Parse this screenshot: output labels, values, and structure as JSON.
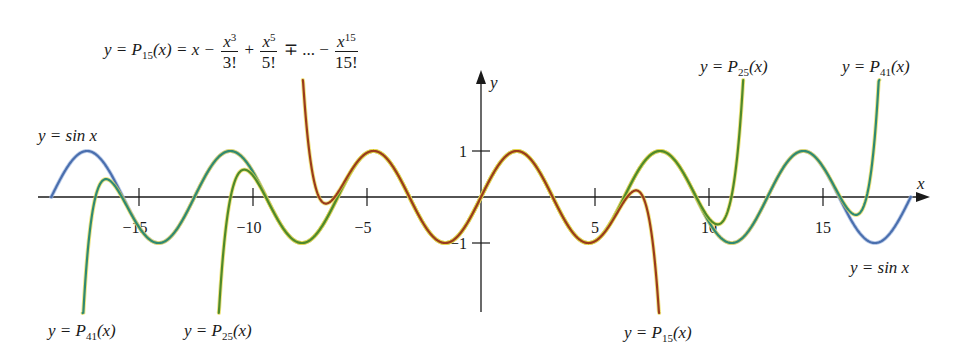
{
  "chart_data": {
    "type": "line",
    "title": "",
    "xlabel": "x",
    "ylabel": "y",
    "xlim": [
      -19.2,
      19.2
    ],
    "ylim": [
      -2.5,
      2.5
    ],
    "grid": false,
    "x_ticks": [
      -15,
      -10,
      -5,
      5,
      10,
      15
    ],
    "x_tick_labels": [
      "−15",
      "−10",
      "−5",
      "5",
      "10",
      "15"
    ],
    "y_ticks": [
      1,
      -1
    ],
    "y_tick_labels": [
      "1",
      "−1"
    ],
    "series": [
      {
        "name": "y = sin x",
        "function": "sin",
        "x_range": [
          -18.85,
          18.85
        ],
        "color": "#4a6fae"
      },
      {
        "name": "y = P15(x)",
        "function": "taylor_sin",
        "degree": 15,
        "x_range": [
          -8.0,
          8.0
        ],
        "color": "#9b3b1c"
      },
      {
        "name": "y = P25(x)",
        "function": "taylor_sin",
        "degree": 25,
        "x_range": [
          -12.0,
          12.0
        ],
        "color": "#4f8a2a"
      },
      {
        "name": "y = P41(x)",
        "function": "taylor_sin",
        "degree": 41,
        "x_range": [
          -17.5,
          17.5
        ],
        "color": "#2f8a72"
      }
    ],
    "annotations": [
      "y = P15(x) = x − x^3/3! + x^5/5! ∓ ... − x^15/15!",
      "y = sin x",
      "y = P41(x)",
      "y = P25(x)",
      "y = P15(x)",
      "y = P25(x)",
      "y = P41(x)",
      "y = sin x"
    ]
  },
  "labels": {
    "formula_lhs": "y = P",
    "formula_sub": "15",
    "formula_mid": "(x) = x −",
    "f1_num": "x",
    "f1_sup": "3",
    "f1_den": "3!",
    "plus": "+",
    "f2_num": "x",
    "f2_sup": "5",
    "f2_den": "5!",
    "mp": "∓ ...  −",
    "f3_num": "x",
    "f3_sup": "15",
    "f3_den": "15!",
    "sin_left": "y = sin x",
    "sin_right": "y = sin x",
    "p41_bottom": "41",
    "p25_bottom": "25",
    "p15_bottom": "15",
    "p25_top": "25",
    "p41_top": "41",
    "y_eq_P": "y = P",
    "paren_x": "(x)",
    "axis_x": "x",
    "axis_y": "y"
  },
  "layout": {
    "origin_px": [
      481,
      197
    ],
    "x_scale": 22.8,
    "y_scale": 46,
    "clip_top": 80,
    "clip_bottom": 313
  }
}
